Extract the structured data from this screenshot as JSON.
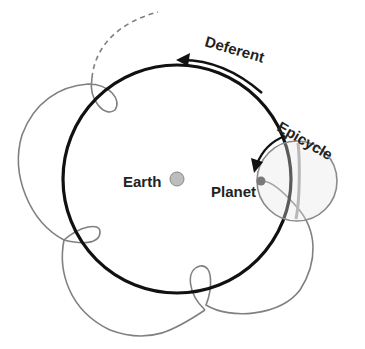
{
  "diagram": {
    "labels": {
      "deferent": "Deferent",
      "epicycle": "Epicycle",
      "earth": "Earth",
      "planet": "Planet"
    },
    "colors": {
      "deferent_stroke": "#111111",
      "path_stroke": "#808080",
      "epicycle_stroke": "#8a8a8a",
      "earth_fill": "#bdbdbd",
      "planet_fill": "#7a7a7a",
      "text": "#222222"
    }
  }
}
